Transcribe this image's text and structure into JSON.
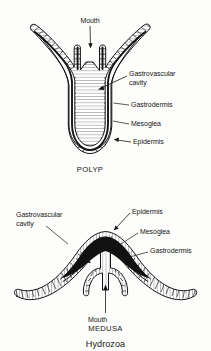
{
  "figure": {
    "title": "Hydrozoa",
    "background_color": "#fdfdfb",
    "ink_color": "#161616",
    "panels": [
      {
        "id": "polyp",
        "caption": "POLYP",
        "labels": [
          {
            "key": "mouth",
            "text": "Mouth"
          },
          {
            "key": "gastrovascular_cavity_line1",
            "text": "Gastrovascular"
          },
          {
            "key": "gastrovascular_cavity_line2",
            "text": "cavity"
          },
          {
            "key": "gastrodermis",
            "text": "Gastrodermis"
          },
          {
            "key": "mesoglea",
            "text": "Mesoglea"
          },
          {
            "key": "epidermis",
            "text": "Epidermis"
          }
        ]
      },
      {
        "id": "medusa",
        "caption": "MEDUSA",
        "labels": [
          {
            "key": "gastrovascular_cavity_line1",
            "text": "Gastrovascular"
          },
          {
            "key": "gastrovascular_cavity_line2",
            "text": "cavity"
          },
          {
            "key": "epidermis",
            "text": "Epidermis"
          },
          {
            "key": "mesoglea",
            "text": "Mesoglea"
          },
          {
            "key": "gastrodermis",
            "text": "Gastrodermis"
          },
          {
            "key": "mouth",
            "text": "Mouth"
          }
        ]
      }
    ],
    "tissue_layers": [
      {
        "name": "Epidermis",
        "color": "#ffffff",
        "pattern": "hatched-band"
      },
      {
        "name": "Mesoglea",
        "color": "#111111",
        "pattern": "solid-dark"
      },
      {
        "name": "Gastrodermis",
        "color": "#ffffff",
        "pattern": "hatched-band"
      }
    ]
  }
}
